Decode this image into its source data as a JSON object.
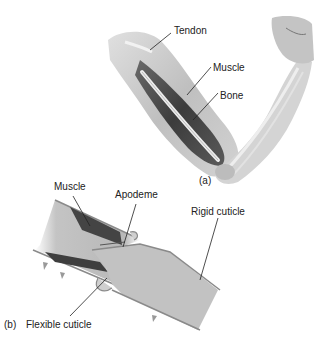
{
  "figure": {
    "panel_a": {
      "panel_label": "(a)",
      "subject": "human arm",
      "labels": {
        "tendon": "Tendon",
        "muscle": "Muscle",
        "bone": "Bone"
      }
    },
    "panel_b": {
      "panel_label": "(b)",
      "subject": "arthropod joint",
      "labels": {
        "muscle": "Muscle",
        "apodeme": "Apodeme",
        "rigid_cuticle": "Rigid cuticle",
        "flexible_cuticle": "Flexible cuticle"
      }
    },
    "colors": {
      "background": "#ffffff",
      "skin": "#c8c8c8",
      "muscle": "#4a4a4a",
      "bone": "#e6e6e6",
      "cuticle_fill": "#bdbdbd",
      "cuticle_edge": "#8a8a8a",
      "text": "#222222"
    }
  }
}
